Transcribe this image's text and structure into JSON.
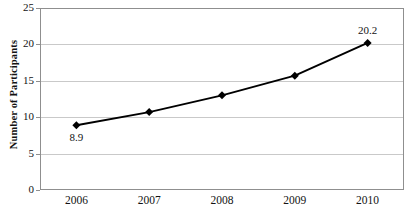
{
  "chart_data": {
    "type": "line",
    "title": "",
    "xlabel": "",
    "ylabel": "Number of Participants",
    "categories": [
      "2006",
      "2007",
      "2008",
      "2009",
      "2010"
    ],
    "values": [
      8.9,
      10.7,
      13.0,
      15.7,
      20.2
    ],
    "point_labels": [
      "8.9",
      "",
      "",
      "",
      "20.2"
    ],
    "ylim": [
      0,
      25
    ],
    "yticks": [
      "0",
      "5",
      "10",
      "15",
      "20",
      "25"
    ],
    "ytick_values": [
      0,
      5,
      10,
      15,
      20,
      25
    ],
    "grid": "horizontal",
    "legend": "none",
    "series": [
      {
        "name": "Number of Participants",
        "values": [
          8.9,
          10.7,
          13.0,
          15.7,
          20.2
        ],
        "line_color": "#000000",
        "marker": "diamond",
        "marker_color": "#000000"
      }
    ],
    "colors": {
      "line": "#000000",
      "marker": "#000000",
      "gridline": "#c9c9c9",
      "frame": "#8f8f8f",
      "text": "#131313",
      "background": "#ffffff"
    }
  }
}
